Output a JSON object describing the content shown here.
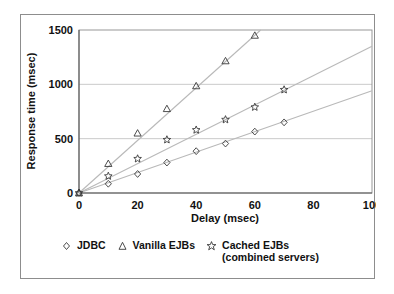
{
  "chart_data": {
    "type": "scatter",
    "title": "",
    "xlabel": "Delay (msec)",
    "ylabel": "Response time (msec)",
    "xlim": [
      0,
      100
    ],
    "ylim": [
      0,
      1500
    ],
    "xticks": [
      "0",
      "20",
      "40",
      "60",
      "80",
      "100"
    ],
    "xtick_values": [
      0,
      20,
      40,
      60,
      80,
      100
    ],
    "yticks": [
      "0",
      "500",
      "1000",
      "1500"
    ],
    "ytick_values": [
      0,
      500,
      1000,
      1500
    ],
    "grid": "horizontal",
    "legend_position": "bottom",
    "series": [
      {
        "name": "JDBC",
        "marker": "diamond",
        "x": [
          0,
          10,
          20,
          30,
          40,
          50,
          60,
          70
        ],
        "values": [
          0,
          85,
          175,
          280,
          385,
          455,
          565,
          650
        ],
        "trend": {
          "x0": 0,
          "y0": 0,
          "x1": 100,
          "y1": 940
        }
      },
      {
        "name": "Vanilla EJBs",
        "marker": "triangle",
        "x": [
          0,
          10,
          20,
          30,
          40,
          50,
          60
        ],
        "values": [
          0,
          270,
          550,
          775,
          985,
          1215,
          1450
        ],
        "trend": {
          "x0": 0,
          "y0": 0,
          "x1": 62,
          "y1": 1500
        }
      },
      {
        "name": "Cached EJBs (combined servers)",
        "marker": "star",
        "x": [
          0,
          10,
          20,
          30,
          40,
          50,
          60,
          70
        ],
        "values": [
          0,
          155,
          315,
          490,
          580,
          675,
          790,
          950
        ],
        "trend": {
          "x0": 0,
          "y0": 0,
          "x1": 100,
          "y1": 1350
        }
      }
    ]
  },
  "legend": {
    "items": [
      {
        "label": "JDBC",
        "marker": "diamond-marker-icon"
      },
      {
        "label": "Vanilla EJBs",
        "marker": "triangle-marker-icon"
      },
      {
        "label": "Cached EJBs (combined servers)",
        "marker": "star-marker-icon"
      }
    ]
  },
  "colors": {
    "marker_stroke": "#3a3a3a",
    "trend_line": "#b9b9b9",
    "grid": "#bdbdbd",
    "axis": "#5a5a5a",
    "frame": "#8d8d8d",
    "text": "#111111",
    "background": "#ffffff"
  }
}
